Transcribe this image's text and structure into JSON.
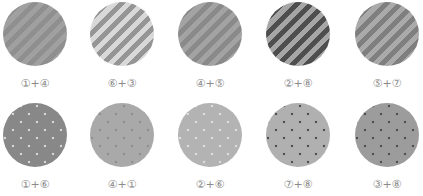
{
  "figure": {
    "rows": [
      {
        "pattern_type": "diagonal-stripes",
        "items": [
          {
            "label": "①+④",
            "stripe_a": "#a0a0a0",
            "stripe_b": "#8f8f8f",
            "dot": null
          },
          {
            "label": "⑥+③",
            "stripe_a": "#d8d8d8",
            "stripe_b": "#959595",
            "dot": null
          },
          {
            "label": "④+⑤",
            "stripe_a": "#a3a3a3",
            "stripe_b": "#8a8a8a",
            "dot": null
          },
          {
            "label": "②+⑧",
            "stripe_a": "#a6a6a6",
            "stripe_b": "#4e4e4e",
            "dot": null
          },
          {
            "label": "⑤+⑦",
            "stripe_a": "#aaaaaa",
            "stripe_b": "#7f7f7f",
            "dot": null
          }
        ]
      },
      {
        "pattern_type": "dots",
        "items": [
          {
            "label": "①+⑥",
            "fill": "#888888",
            "dot": "#d6d6d6"
          },
          {
            "label": "④+①",
            "fill": "#a9a9a9",
            "dot": "#8e8e8e"
          },
          {
            "label": "②+⑥",
            "fill": "#b3b3b3",
            "dot": "#dcdcdc"
          },
          {
            "label": "⑦+⑧",
            "fill": "#b0b0b0",
            "dot": "#505050"
          },
          {
            "label": "③+⑧",
            "fill": "#9c9c9c",
            "dot": "#505050"
          }
        ]
      }
    ]
  }
}
